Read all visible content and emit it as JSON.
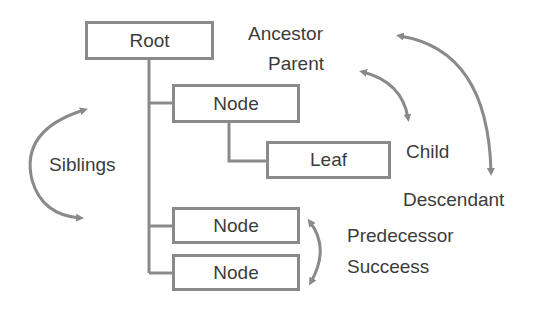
{
  "diagram": {
    "type": "tree-terminology",
    "nodes": {
      "root": "Root",
      "node1": "Node",
      "leaf": "Leaf",
      "node2": "Node",
      "node3": "Node"
    },
    "labels": {
      "ancestor": "Ancestor",
      "parent": "Parent",
      "child": "Child",
      "descendant": "Descendant",
      "siblings": "Siblings",
      "predecessor": "Predecessor",
      "successor": "Succeess"
    },
    "colors": {
      "line": "#8a8a8a",
      "text": "#3c3c3c",
      "background": "#ffffff"
    }
  }
}
